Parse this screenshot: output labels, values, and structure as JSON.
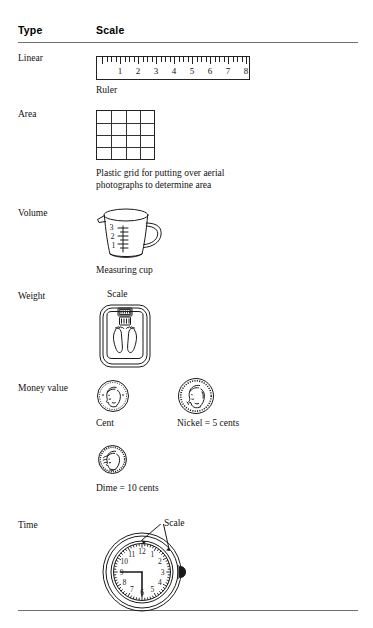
{
  "table": {
    "headers": {
      "type": "Type",
      "scale": "Scale"
    },
    "rows": [
      {
        "type": "Linear",
        "caption": "Ruler",
        "figure": "ruler-figure",
        "ruler": {
          "numbers": [
            "1",
            "2",
            "3",
            "4",
            "5",
            "6",
            "7",
            "8"
          ],
          "major_ticks": 8,
          "minor_per_major": 4
        }
      },
      {
        "type": "Area",
        "caption": "Plastic grid for putting over aerial photographs to determine area",
        "caption_line1": "Plastic grid for putting over aerial",
        "caption_line2": "photographs to determine area",
        "figure": "grid-figure",
        "grid": {
          "columns": 4,
          "rows": 4
        }
      },
      {
        "type": "Volume",
        "caption": "Measuring cup",
        "figure": "measuring-cup-figure",
        "cup_marks": [
          "3",
          "2",
          "1"
        ]
      },
      {
        "type": "Weight",
        "caption": "",
        "label_above": "Scale",
        "figure": "bathroom-scale-figure"
      },
      {
        "type": "Money value",
        "figure": "coins-figure",
        "coins": [
          {
            "name": "Cent",
            "caption": "Cent"
          },
          {
            "name": "Nickel",
            "caption": "Nickel = 5 cents"
          },
          {
            "name": "Dime",
            "caption": "Dime = 10 cents"
          }
        ]
      },
      {
        "type": "Time",
        "figure": "clock-figure",
        "label": "Scale",
        "clock": {
          "numerals": [
            "12",
            "1",
            "2",
            "3",
            "4",
            "5",
            "6",
            "7",
            "8",
            "9",
            "10",
            "11"
          ],
          "hour_hand": 9,
          "minute_hand": 6
        }
      }
    ]
  },
  "colors": {
    "ink": "#111111",
    "rule": "#6f6f6f",
    "line": "#222222",
    "page": "#ffffff"
  }
}
